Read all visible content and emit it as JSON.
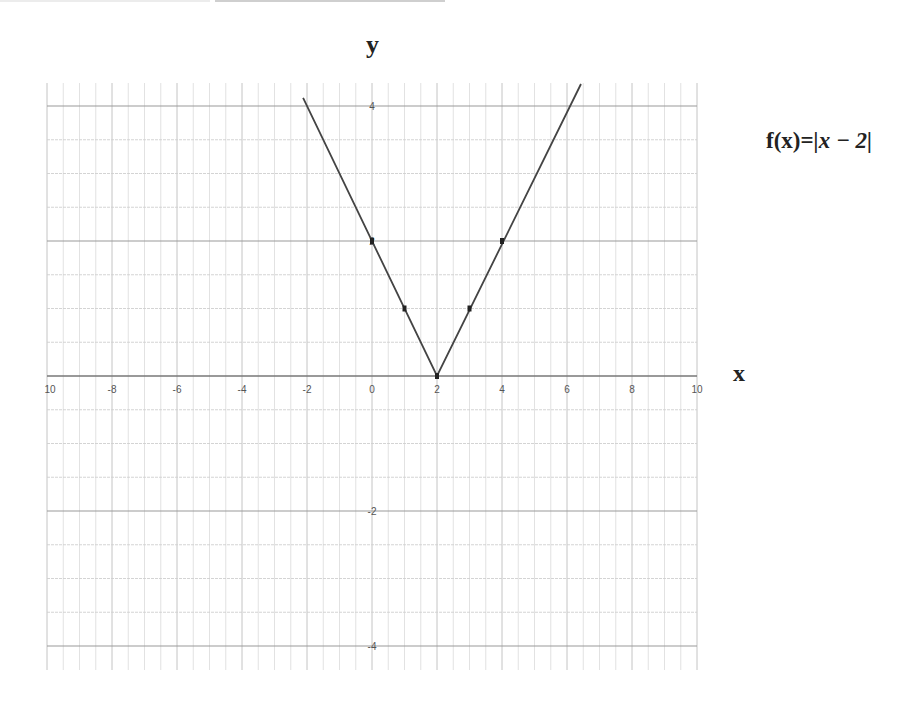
{
  "chart_data": {
    "type": "line",
    "title": "",
    "function_label": "f(x)=|x − 2|",
    "function_label_prefix": "f(x)=",
    "function_label_expr": "|x − 2|",
    "xlabel": "x",
    "ylabel": "y",
    "xlim": [
      -10,
      10
    ],
    "ylim": [
      -4.3,
      4.35
    ],
    "x_ticks": [
      -10,
      -8,
      -6,
      -4,
      -2,
      0,
      2,
      4,
      6,
      8,
      10
    ],
    "x_tick_labels": [
      "10",
      "-8",
      "-6",
      "-4",
      "-2",
      "0",
      "2",
      "4",
      "6",
      "8",
      "10"
    ],
    "y_ticks": [
      4,
      2,
      -2,
      -4
    ],
    "y_tick_labels": [
      "4",
      "2",
      "-2",
      "-4"
    ],
    "grid": true,
    "series": [
      {
        "name": "f(x)=|x-2|",
        "x": [
          -2.12,
          2,
          6.43
        ],
        "y": [
          4.12,
          0,
          4.43
        ],
        "color": "#444444"
      }
    ],
    "points": [
      {
        "x": 0,
        "y": 2
      },
      {
        "x": 1,
        "y": 1
      },
      {
        "x": 2,
        "y": 0
      },
      {
        "x": 3,
        "y": 1
      },
      {
        "x": 4,
        "y": 2
      }
    ],
    "colors": {
      "line": "#444444",
      "axis": "#777777",
      "grid": "#d6d6d6",
      "text": "#222222"
    }
  }
}
